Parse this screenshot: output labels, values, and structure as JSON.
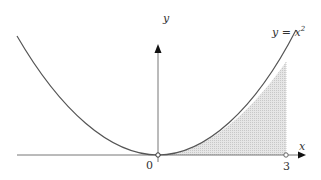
{
  "diagram": {
    "function_label": "y = x²",
    "function_label_base": "y = x",
    "function_label_exp": "2",
    "x_axis_label": "x",
    "y_axis_label": "y",
    "origin_label": "0",
    "bound_label": "3",
    "shaded_region": {
      "from": 0,
      "to": 3,
      "fill": "#d9d9d9"
    },
    "curve_color": "#555555",
    "axis_color": "#777777"
  }
}
